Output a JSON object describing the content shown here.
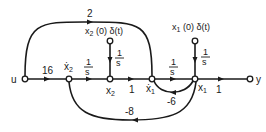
{
  "diagram": {
    "type": "signal-flow-graph",
    "nodes": [
      {
        "id": "u",
        "label": "u"
      },
      {
        "id": "x2dot",
        "label": "ẋ",
        "sub": "2"
      },
      {
        "id": "x2",
        "label": "x",
        "sub": "2"
      },
      {
        "id": "x1dot",
        "label": "ẋ",
        "sub": "1"
      },
      {
        "id": "x1",
        "label": "x",
        "sub": "1"
      },
      {
        "id": "y",
        "label": "y"
      },
      {
        "id": "x2init",
        "label_pre": "x",
        "sub": "2",
        "label_post": " (0) δ(t)"
      },
      {
        "id": "x1init",
        "label_pre": "x",
        "sub": "1",
        "label_post": " (0) δ(t)"
      }
    ],
    "gains": {
      "u_x2dot": "16",
      "x2dot_x2": {
        "num": "1",
        "den": "s"
      },
      "x2init_x2": {
        "num": "1",
        "den": "s"
      },
      "x2_x1dot": "1",
      "x1dot_x1": {
        "num": "1",
        "den": "s"
      },
      "x1init_x1": {
        "num": "1",
        "den": "s"
      },
      "x1_y": "1",
      "u_x1dot": "2",
      "x1_x1dot": "-6",
      "x1_x2dot": "-8"
    }
  }
}
